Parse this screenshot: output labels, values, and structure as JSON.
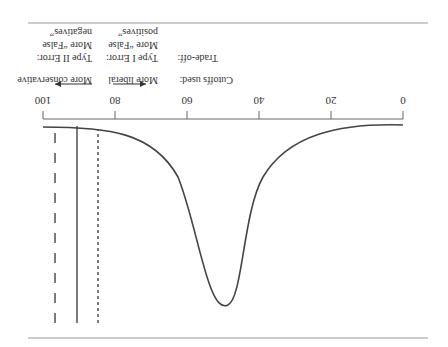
{
  "figure": {
    "orientation": "rotated 180 degrees",
    "axis": {
      "ticks": [
        {
          "value": "0"
        },
        {
          "value": "20"
        },
        {
          "value": "40"
        },
        {
          "value": "60"
        },
        {
          "value": "80"
        },
        {
          "value": "100"
        }
      ]
    },
    "annotations": {
      "cutoffs_label": "Cutoffs used:",
      "tradeoff_label": "Trade-off:",
      "liberal": {
        "direction": "More liberal",
        "error_line1": "Type I Error:",
        "error_line2": "More “False",
        "error_line3": "positives”"
      },
      "conservative": {
        "direction": "More conservative",
        "error_line1": "Type II Error:",
        "error_line2": "More “False",
        "error_line3": "negatives”"
      }
    },
    "cutoff_lines": [
      {
        "style": "dotted",
        "position": 85
      },
      {
        "style": "solid",
        "position": 91
      },
      {
        "style": "dashed",
        "position": 97
      }
    ],
    "curve": {
      "description": "sigmoid-shaped curve dipping from top near 0 to a minimum near 49 and back up to top near 100",
      "minimum_position": 49
    },
    "colors": {
      "line": "#444444",
      "rule": "#999999",
      "text": "#333333"
    }
  }
}
